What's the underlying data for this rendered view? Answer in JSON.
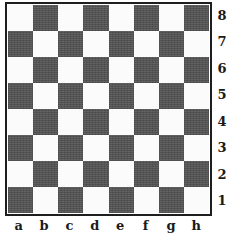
{
  "diagram": {
    "type": "chessboard",
    "orientation": "white-bottom",
    "colors": {
      "light_square": "#fbfbfb",
      "dark_square": "#575757",
      "border": "#1e1e1e",
      "label": "#1a1a1a"
    },
    "files": [
      "a",
      "b",
      "c",
      "d",
      "e",
      "f",
      "g",
      "h"
    ],
    "ranks": [
      "8",
      "7",
      "6",
      "5",
      "4",
      "3",
      "2",
      "1"
    ],
    "squares": [
      [
        "light",
        "dark",
        "light",
        "dark",
        "light",
        "dark",
        "light",
        "dark"
      ],
      [
        "dark",
        "light",
        "dark",
        "light",
        "dark",
        "light",
        "dark",
        "light"
      ],
      [
        "light",
        "dark",
        "light",
        "dark",
        "light",
        "dark",
        "light",
        "dark"
      ],
      [
        "dark",
        "light",
        "dark",
        "light",
        "dark",
        "light",
        "dark",
        "light"
      ],
      [
        "light",
        "dark",
        "light",
        "dark",
        "light",
        "dark",
        "light",
        "dark"
      ],
      [
        "dark",
        "light",
        "dark",
        "light",
        "dark",
        "light",
        "dark",
        "light"
      ],
      [
        "light",
        "dark",
        "light",
        "dark",
        "light",
        "dark",
        "light",
        "dark"
      ],
      [
        "dark",
        "light",
        "dark",
        "light",
        "dark",
        "light",
        "dark",
        "light"
      ]
    ],
    "pieces": []
  },
  "caption": {
    "cropped_text": ""
  }
}
